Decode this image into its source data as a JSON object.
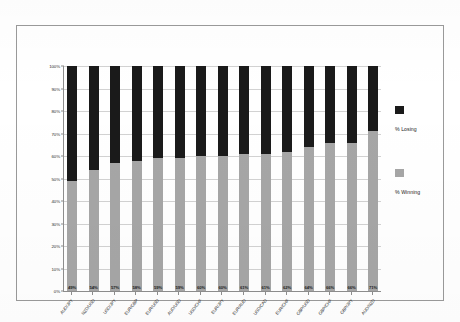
{
  "chart_data": {
    "type": "bar",
    "subtype": "stacked-100-percent",
    "title": "",
    "subtitle": "",
    "xlabel": "",
    "ylabel": "",
    "ylim": [
      0,
      100
    ],
    "ytick_labels": [
      "100%",
      "90%",
      "80%",
      "70%",
      "60%",
      "50%",
      "40%",
      "30%",
      "20%",
      "10%",
      "0%"
    ],
    "ytick_values": [
      100,
      90,
      80,
      70,
      60,
      50,
      40,
      30,
      20,
      10,
      0
    ],
    "grid": true,
    "legend_position": "right",
    "categories": [
      "AUD/JPY",
      "NZD/USD",
      "USD/JPY",
      "EUR/GBP",
      "EUR/USD",
      "AUD/USD",
      "USD/CHF",
      "EUR/JPY",
      "EUR/AUD",
      "USD/CAD",
      "EUR/CHF",
      "GBP/USD",
      "GBP/CHF",
      "GBP/JPY",
      "AUD/NZD"
    ],
    "series": [
      {
        "name": "% Winning",
        "color": "#a6a6a6",
        "values": [
          49,
          54,
          57,
          58,
          59,
          59,
          60,
          60,
          61,
          61,
          62,
          64,
          66,
          66,
          71
        ],
        "data_labels": [
          "49%",
          "54%",
          "57%",
          "58%",
          "59%",
          "59%",
          "60%",
          "60%",
          "61%",
          "61%",
          "62%",
          "64%",
          "66%",
          "66%",
          "71%"
        ]
      },
      {
        "name": "% Losing",
        "color": "#1a1a1a",
        "values": [
          51,
          46,
          43,
          42,
          41,
          41,
          40,
          40,
          39,
          39,
          38,
          36,
          34,
          34,
          29
        ],
        "data_labels": []
      }
    ],
    "legend": [
      {
        "label": "% Losing",
        "color": "#1a1a1a"
      },
      {
        "label": "% Winning",
        "color": "#a6a6a6"
      }
    ]
  }
}
